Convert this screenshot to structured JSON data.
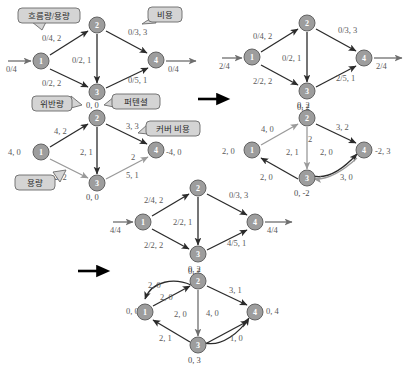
{
  "figure": {
    "colors": {
      "node_fill": "#9d9d9d",
      "node_stroke": "#636363",
      "edge_dark": "#2b2b2b",
      "edge_gray": "#9a9a9a",
      "callout_fill": "#d4d4d4",
      "text": "#4a4a4a"
    },
    "node_labels": [
      "1",
      "2",
      "3",
      "4"
    ],
    "callouts": [
      {
        "id": "flow-capacity",
        "text": "흐름량/용량"
      },
      {
        "id": "cost",
        "text": "비용"
      },
      {
        "id": "violation",
        "text": "위반량"
      },
      {
        "id": "potential",
        "text": "퍼텐셜"
      },
      {
        "id": "cover-cost",
        "text": "커버 비용"
      },
      {
        "id": "capacity",
        "text": "용량"
      }
    ],
    "panels": [
      {
        "id": "panel-top-left",
        "name": "initial-network",
        "source_label": "0/4",
        "sink_label": "0/4",
        "edge_labels": [
          "0/4, 2",
          "0/2, 2",
          "0/2, 1",
          "0/3, 3",
          "0/5, 1"
        ]
      },
      {
        "id": "panel-top-right",
        "name": "network-after-first-augment",
        "source_label": "2/4",
        "sink_label": "2/4",
        "edge_labels": [
          "0/4, 2",
          "2/2, 2",
          "0/2, 1",
          "0/3, 3",
          "2/5, 1"
        ],
        "node_annotations": {
          "node3": "0, 2"
        }
      },
      {
        "id": "panel-mid-left",
        "name": "residual-network-initial",
        "node_annotations": {
          "node1": "4, 0",
          "node2": "0, 0",
          "node3": "0, 0",
          "node4": "-4, 0"
        },
        "edge_labels": [
          "4, 2",
          "2, 2",
          "2, 1",
          "3, 3",
          "5, 1",
          "2"
        ]
      },
      {
        "id": "panel-mid-right",
        "name": "residual-network-after-augment",
        "node_annotations": {
          "node1": "2, 0",
          "node2": "0, 2",
          "node3": "0, -2",
          "node4": "-2, 3"
        },
        "edge_labels": [
          "4, 0",
          "2, 0",
          "2, 1",
          "3, 2",
          "2, 0",
          "3, 0",
          "2"
        ]
      },
      {
        "id": "panel-bottom-mid",
        "name": "network-final-flow",
        "source_label": "4/4",
        "sink_label": "4/4",
        "edge_labels": [
          "2/4, 2",
          "2/2, 2",
          "2/2, 1",
          "0/3, 3",
          "4/5, 1"
        ],
        "node_annotations": {
          "node3": "0, 2"
        }
      },
      {
        "id": "panel-bottom",
        "name": "residual-network-final",
        "node_annotations": {
          "node1": "0, 0",
          "node2": "0, 2",
          "node3": "0, 3",
          "node4": "0, 4"
        },
        "edge_labels": [
          "2, 0",
          "2, 0",
          "2, 0",
          "2, 1",
          "3, 1",
          "4, 0",
          "1, 0"
        ]
      }
    ],
    "step_arrows": [
      {
        "id": "arrow-1",
        "name": "step-arrow-right"
      },
      {
        "id": "arrow-2",
        "name": "step-arrow-down-left"
      }
    ]
  }
}
